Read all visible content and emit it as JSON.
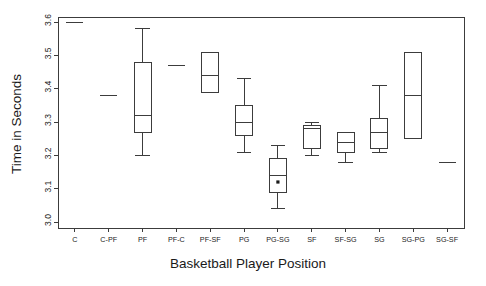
{
  "chart_data": {
    "type": "box",
    "title": "",
    "xlabel": "Basketball Player Position",
    "ylabel": "Time in Seconds",
    "ylim": [
      3.0,
      3.6
    ],
    "yticks": [
      "3.0",
      "3.1",
      "3.2",
      "3.3",
      "3.4",
      "3.5",
      "3.6"
    ],
    "ytick_values": [
      3.0,
      3.1,
      3.2,
      3.3,
      3.4,
      3.5,
      3.6
    ],
    "grid": false,
    "legend": "none",
    "categories": [
      "C",
      "C-PF",
      "PF",
      "PF-C",
      "PF-SF",
      "PG",
      "PG-SG",
      "SF",
      "SF-SG",
      "SG",
      "SG-PG",
      "SG-SF"
    ],
    "boxes": [
      {
        "category": "C",
        "whisker_low": 3.6,
        "q1": 3.6,
        "median": 3.6,
        "q3": 3.6,
        "whisker_high": 3.6,
        "outliers": [],
        "degenerate": true
      },
      {
        "category": "C-PF",
        "whisker_low": 3.38,
        "q1": 3.38,
        "median": 3.38,
        "q3": 3.38,
        "whisker_high": 3.38,
        "outliers": [],
        "degenerate": true
      },
      {
        "category": "PF",
        "whisker_low": 3.2,
        "q1": 3.27,
        "median": 3.32,
        "q3": 3.48,
        "whisker_high": 3.58,
        "outliers": [],
        "degenerate": false
      },
      {
        "category": "PF-C",
        "whisker_low": 3.47,
        "q1": 3.47,
        "median": 3.47,
        "q3": 3.47,
        "whisker_high": 3.47,
        "outliers": [],
        "degenerate": true
      },
      {
        "category": "PF-SF",
        "whisker_low": 3.39,
        "q1": 3.39,
        "median": 3.44,
        "q3": 3.51,
        "whisker_high": 3.51,
        "outliers": [],
        "degenerate": false
      },
      {
        "category": "PG",
        "whisker_low": 3.21,
        "q1": 3.26,
        "median": 3.3,
        "q3": 3.35,
        "whisker_high": 3.43,
        "outliers": [],
        "degenerate": false
      },
      {
        "category": "PG-SG",
        "whisker_low": 3.04,
        "q1": 3.09,
        "median": 3.14,
        "q3": 3.19,
        "whisker_high": 3.23,
        "outliers": [
          3.12
        ],
        "degenerate": false
      },
      {
        "category": "SF",
        "whisker_low": 3.2,
        "q1": 3.22,
        "median": 3.28,
        "q3": 3.29,
        "whisker_high": 3.3,
        "outliers": [],
        "degenerate": false
      },
      {
        "category": "SF-SG",
        "whisker_low": 3.18,
        "q1": 3.21,
        "median": 3.24,
        "q3": 3.27,
        "whisker_high": 3.27,
        "outliers": [],
        "degenerate": false
      },
      {
        "category": "SG",
        "whisker_low": 3.21,
        "q1": 3.22,
        "median": 3.27,
        "q3": 3.31,
        "whisker_high": 3.41,
        "outliers": [],
        "degenerate": false
      },
      {
        "category": "SG-PG",
        "whisker_low": 3.25,
        "q1": 3.25,
        "median": 3.38,
        "q3": 3.51,
        "whisker_high": 3.51,
        "outliers": [],
        "degenerate": false
      },
      {
        "category": "SG-SF",
        "whisker_low": 3.18,
        "q1": 3.18,
        "median": 3.18,
        "q3": 3.18,
        "whisker_high": 3.18,
        "outliers": [],
        "degenerate": true
      }
    ]
  },
  "axes": {
    "y_title": "Time in Seconds",
    "x_title": "Basketball Player Position"
  }
}
